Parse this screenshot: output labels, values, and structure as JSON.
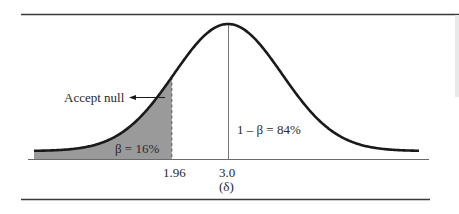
{
  "chart_data": {
    "type": "area",
    "title": "",
    "distribution": {
      "family": "normal",
      "mean": 3.0,
      "sd": 1.0
    },
    "critical_value": 1.96,
    "center_value": 3.0,
    "x_ticks": [
      {
        "value": 1.96,
        "label": "1.96"
      },
      {
        "value": 3.0,
        "label": "3.0",
        "sublabel": "(δ)"
      }
    ],
    "x_range": [
      -0.6,
      6.6
    ],
    "shaded_region": {
      "from": -0.6,
      "to": 1.96,
      "label": "β = 16%",
      "value_pct": 16,
      "color": "#9a9a9a"
    },
    "unshaded_region": {
      "label": "1 – β = 84%",
      "value_pct": 84
    },
    "annotations": [
      {
        "text": "Accept null",
        "arrow": "right",
        "points_to": "critical value line"
      }
    ],
    "xlabel": "",
    "ylabel": "",
    "grid": false,
    "legend": null
  },
  "labels": {
    "accept_null": "Accept null",
    "beta": "β = 16%",
    "power": "1 – β = 84%",
    "tick_critical": "1.96",
    "tick_center": "3.0",
    "tick_center_sub": "(δ)"
  },
  "colors": {
    "curve": "#1a1a1a",
    "shade": "#9a9a9a",
    "rule": "#3a3a3a",
    "axis": "#6a6a6a"
  }
}
